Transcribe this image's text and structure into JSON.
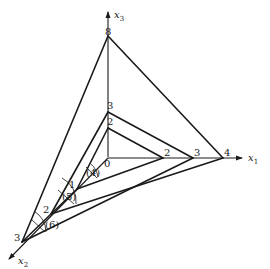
{
  "figure": {
    "axes": {
      "x1": {
        "label": "x",
        "sub": "1"
      },
      "x2": {
        "label": "x",
        "sub": "2"
      },
      "x3": {
        "label": "x",
        "sub": "3"
      }
    },
    "vertex_labels": {
      "origin": "0",
      "x3_8": "8",
      "x3_3": "3",
      "x3_2": "2",
      "x1_2": "2",
      "x1_3": "3",
      "x1_4": "4",
      "x2_1": "1",
      "x2_2": "2",
      "x2_3": "3"
    },
    "angle_labels": [
      "(4)",
      "(5)",
      "(6)"
    ]
  }
}
